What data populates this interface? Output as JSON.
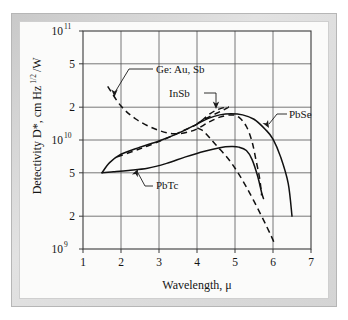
{
  "figure": {
    "background_color": "#fbfbfa",
    "frame_color": "#d4d4d4",
    "axis_color": "#3a3a3a",
    "curve_color": "#111111"
  },
  "chart_data": {
    "type": "line",
    "title": "",
    "subtitle": "",
    "xlabel": "Wavelength, μ",
    "ylabel": "Detectivity D*, cm Hz",
    "ylabel_exponent": "1/2",
    "ylabel_tail": "/W",
    "xlim": [
      1,
      7
    ],
    "ylim": [
      1000000000,
      100000000000
    ],
    "yscale": "log",
    "xscale": "linear",
    "grid": true,
    "legend_position": "inline-annotations",
    "xticks": [
      1,
      2,
      3,
      4,
      5,
      6,
      7
    ],
    "xtick_labels": [
      "1",
      "2",
      "3",
      "4",
      "5",
      "6",
      "7"
    ],
    "yticks": [
      1000000000,
      2000000000,
      5000000000,
      10000000000,
      20000000000,
      50000000000,
      100000000000
    ],
    "ytick_labels": [
      "10",
      "2",
      "5",
      "10",
      "2",
      "5",
      "10"
    ],
    "ytick_exponents": [
      "9",
      "",
      "",
      "10",
      "",
      "",
      "11"
    ],
    "series": [
      {
        "name": "PbSe",
        "style": "solid",
        "label": "PbSe",
        "points": [
          [
            1.5,
            5000000000.0
          ],
          [
            1.7,
            6200000000.0
          ],
          [
            2.0,
            7400000000.0
          ],
          [
            2.5,
            8600000000.0
          ],
          [
            3.0,
            9800000000.0
          ],
          [
            3.5,
            11500000000.0
          ],
          [
            4.0,
            14000000000.0
          ],
          [
            4.3,
            15800000000.0
          ],
          [
            4.6,
            17000000000.0
          ],
          [
            4.9,
            17400000000.0
          ],
          [
            5.2,
            17000000000.0
          ],
          [
            5.5,
            15500000000.0
          ],
          [
            5.8,
            12500000000.0
          ],
          [
            6.0,
            10200000000.0
          ],
          [
            6.2,
            7000000000.0
          ],
          [
            6.4,
            4000000000.0
          ],
          [
            6.5,
            2000000000.0
          ]
        ]
      },
      {
        "name": "PbTc",
        "style": "solid",
        "label": "PbTc",
        "points": [
          [
            1.5,
            5000000000.0
          ],
          [
            1.8,
            5100000000.0
          ],
          [
            2.2,
            5250000000.0
          ],
          [
            2.7,
            5500000000.0
          ],
          [
            3.2,
            6100000000.0
          ],
          [
            3.7,
            7000000000.0
          ],
          [
            4.2,
            7900000000.0
          ],
          [
            4.6,
            8500000000.0
          ],
          [
            4.9,
            8700000000.0
          ],
          [
            5.1,
            8600000000.0
          ],
          [
            5.3,
            8000000000.0
          ],
          [
            5.45,
            6600000000.0
          ],
          [
            5.6,
            4600000000.0
          ],
          [
            5.7,
            3300000000.0
          ],
          [
            5.75,
            2900000000.0
          ]
        ]
      },
      {
        "name": "Ge: Au, Sb",
        "style": "dashed",
        "label": "Ge: Au, Sb",
        "points": [
          [
            1.65,
            31000000000.0
          ],
          [
            2.0,
            20500000000.0
          ],
          [
            2.4,
            15500000000.0
          ],
          [
            2.9,
            12600000000.0
          ],
          [
            3.4,
            11400000000.0
          ],
          [
            3.9,
            12200000000.0
          ],
          [
            4.3,
            14500000000.0
          ],
          [
            4.6,
            16200000000.0
          ],
          [
            4.9,
            17000000000.0
          ],
          [
            5.1,
            16200000000.0
          ],
          [
            5.3,
            13300000000.0
          ],
          [
            5.45,
            9600000000.0
          ],
          [
            5.55,
            6600000000.0
          ],
          [
            5.65,
            4400000000.0
          ],
          [
            5.7,
            3100000000.0
          ]
        ]
      },
      {
        "name": "InSb",
        "style": "dashed",
        "label": "InSb",
        "points": [
          [
            1.9,
            7000000000.0
          ],
          [
            2.5,
            8300000000.0
          ],
          [
            3.1,
            10000000000.0
          ],
          [
            3.6,
            12000000000.0
          ],
          [
            4.0,
            14000000000.0
          ],
          [
            4.35,
            17500000000.0
          ],
          [
            4.6,
            19300000000.0
          ],
          [
            4.8,
            19700000000.0
          ],
          [
            4.0,
            14000000000.0
          ],
          [
            4.2,
            11800000000.0
          ],
          [
            4.5,
            9000000000.0
          ],
          [
            4.9,
            6200000000.0
          ],
          [
            5.3,
            3700000000.0
          ],
          [
            5.7,
            2000000000.0
          ],
          [
            5.95,
            1320000000.0
          ],
          [
            6.05,
            1100000000.0
          ]
        ]
      }
    ],
    "annotations": [
      {
        "name": "ge-au-sb",
        "text": "Ge: Au, Sb",
        "target_x": 2.05,
        "target_y": 20000000000.0
      },
      {
        "name": "insb",
        "text": "InSb",
        "target_x": 4.45,
        "target_y": 19500000000.0
      },
      {
        "name": "pbse",
        "text": "PbSe",
        "target_x": 5.85,
        "target_y": 10500000000.0
      },
      {
        "name": "pbtc",
        "text": "PbTc",
        "target_x": 2.75,
        "target_y": 5500000000.0
      }
    ]
  }
}
